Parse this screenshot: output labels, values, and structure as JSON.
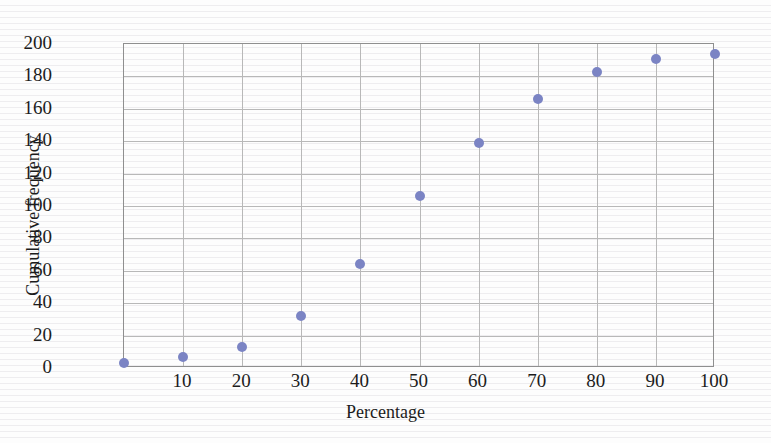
{
  "chart_data": {
    "type": "scatter",
    "title": "",
    "xlabel": "Percentage",
    "ylabel": "Cumulative frequency",
    "xlim": [
      0,
      100
    ],
    "ylim": [
      0,
      200
    ],
    "xticks": [
      "10",
      "20",
      "30",
      "40",
      "50",
      "60",
      "70",
      "80",
      "90",
      "100"
    ],
    "xtick_values": [
      10,
      20,
      30,
      40,
      50,
      60,
      70,
      80,
      90,
      100
    ],
    "yticks": [
      "0",
      "20",
      "40",
      "60",
      "80",
      "100",
      "120",
      "140",
      "160",
      "180",
      "200"
    ],
    "ytick_values": [
      0,
      20,
      40,
      60,
      80,
      100,
      120,
      140,
      160,
      180,
      200
    ],
    "grid": true,
    "grid_color": "#b8b8b8",
    "legend": null,
    "marker_color": "#7b84c4",
    "marker_size": 10,
    "x": [
      0,
      10,
      20,
      30,
      40,
      50,
      60,
      70,
      80,
      90,
      100
    ],
    "values": [
      3,
      7,
      13,
      32,
      64,
      106,
      139,
      166,
      183,
      191,
      194
    ],
    "points": [
      {
        "x": 0,
        "y": 3
      },
      {
        "x": 10,
        "y": 7
      },
      {
        "x": 20,
        "y": 13
      },
      {
        "x": 30,
        "y": 32
      },
      {
        "x": 40,
        "y": 64
      },
      {
        "x": 50,
        "y": 106
      },
      {
        "x": 60,
        "y": 139
      },
      {
        "x": 70,
        "y": 166
      },
      {
        "x": 80,
        "y": 183
      },
      {
        "x": 90,
        "y": 191
      },
      {
        "x": 100,
        "y": 194
      }
    ]
  }
}
